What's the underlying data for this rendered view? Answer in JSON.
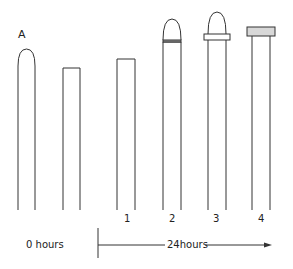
{
  "figure": {
    "panel_label": "A",
    "columns": [
      {
        "id": "A-intact",
        "label": "",
        "shape": "dome-tip"
      },
      {
        "id": "decapitated-0h",
        "label": "",
        "shape": "flat-cut"
      },
      {
        "id": "1",
        "label": "1",
        "shape": "flat-cut"
      },
      {
        "id": "2",
        "label": "2",
        "shape": "dome-with-band"
      },
      {
        "id": "3",
        "label": "3",
        "shape": "dome-with-collar"
      },
      {
        "id": "4",
        "label": "4",
        "shape": "flat-cap"
      }
    ],
    "time_labels": {
      "start": "0 hours",
      "end": "24hours"
    },
    "colors": {
      "stroke": "#333333",
      "cap_fill": "#d8d8d8",
      "background": "#ffffff"
    }
  }
}
